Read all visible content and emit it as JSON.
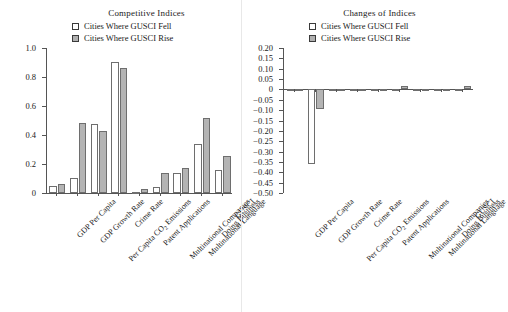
{
  "figure": {
    "background": "#ffffff",
    "bar_fell_color": "#ffffff",
    "bar_rise_color": "#b4b4b4",
    "bar_edge_color": "#6e6e6e",
    "axis_color": "#555555"
  },
  "legend": {
    "fell_label": "Cities Where GUSCI Fell",
    "rise_label": "Cities Where GUSCI Rise"
  },
  "categories": [
    "GDP Per Capita",
    "GDP Growth Rate",
    "Per Capita CO2 Emissions",
    "Crime Rate",
    "Patent Applications",
    "Multinational Companies",
    "Multinational Language",
    "Doing Business",
    "GUSCI"
  ],
  "chart_data": [
    {
      "type": "bar",
      "id": "competitive-indices",
      "title": "Competitive Indices",
      "xlabel": "",
      "ylabel": "",
      "ylim": [
        0,
        1.0
      ],
      "yticks": [
        0,
        0.2,
        0.4,
        0.6,
        0.8,
        1.0
      ],
      "ytick_labels": [
        "0",
        "0.2",
        "0.4",
        "0.6",
        "0.8",
        "1.0"
      ],
      "grid": false,
      "legend_position": "top-center",
      "categories": [
        "GDP Per Capita",
        "GDP Growth Rate",
        "Per Capita CO2 Emissions",
        "Crime Rate",
        "Patent Applications",
        "Multinational Companies",
        "Multinational Language",
        "Doing Business",
        "GUSCI"
      ],
      "series": [
        {
          "name": "Cities Where GUSCI Fell",
          "values": [
            0.045,
            0.105,
            0.475,
            0.905,
            0.005,
            0.04,
            0.135,
            0.335,
            0.16
          ]
        },
        {
          "name": "Cities Where GUSCI Rise",
          "values": [
            0.065,
            0.48,
            0.43,
            0.865,
            0.03,
            0.135,
            0.17,
            0.515,
            0.255
          ]
        }
      ]
    },
    {
      "type": "bar",
      "id": "changes-of-indices",
      "title": "Changes of Indices",
      "xlabel": "",
      "ylabel": "",
      "ylim": [
        -0.5,
        0.2
      ],
      "yticks": [
        0.2,
        0.15,
        0.1,
        0.05,
        0,
        -0.05,
        -0.1,
        -0.15,
        -0.2,
        -0.25,
        -0.3,
        -0.35,
        -0.4,
        -0.45,
        -0.5
      ],
      "ytick_labels": [
        "0.20",
        "0.15",
        "0.10",
        "0.05",
        "0",
        "-0.05",
        "-0.10",
        "-0.15",
        "-0.20",
        "-0.25",
        "-0.30",
        "-0.35",
        "-0.40",
        "-0.45",
        "-0.50"
      ],
      "grid": false,
      "legend_position": "top-center",
      "categories": [
        "GDP Per Capita",
        "GDP Growth Rate",
        "Per Capita CO2 Emissions",
        "Crime Rate",
        "Patent Applications",
        "Multinational Companies",
        "Multinational Language",
        "Doing Business",
        "GUSCI"
      ],
      "series": [
        {
          "name": "Cities Where GUSCI Fell",
          "values": [
            0.004,
            -0.36,
            0.0,
            0.0,
            -0.002,
            0.002,
            0.0,
            0.0,
            0.004
          ]
        },
        {
          "name": "Cities Where GUSCI Rise",
          "values": [
            0.003,
            -0.095,
            0.0,
            0.003,
            0.003,
            0.018,
            0.0,
            0.0,
            0.018
          ]
        }
      ]
    }
  ]
}
